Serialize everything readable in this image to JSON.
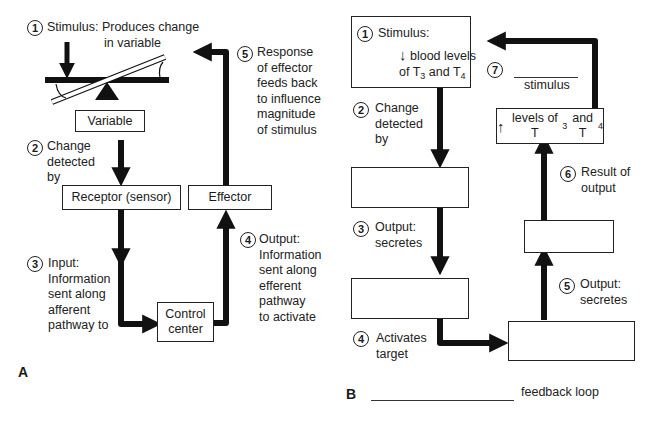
{
  "panel_a": {
    "label": "A",
    "steps": [
      {
        "num": "1",
        "text": "Stimulus: Produces change",
        "text2": "in variable"
      },
      {
        "num": "2",
        "lines": [
          "Change",
          "detected",
          "by"
        ]
      },
      {
        "num": "3",
        "lines": [
          "Input:",
          "Information",
          "sent along",
          "afferent",
          "pathway to"
        ]
      },
      {
        "num": "4",
        "lines": [
          "Output:",
          "Information",
          "sent along",
          "efferent",
          "pathway",
          "to activate"
        ]
      },
      {
        "num": "5",
        "lines": [
          "Response",
          "of effector",
          "feeds back",
          "to influence",
          "magnitude",
          "of stimulus"
        ]
      }
    ],
    "boxes": {
      "variable": "Variable",
      "receptor": "Receptor (sensor)",
      "effector": "Effector",
      "control_line1": "Control",
      "control_line2": "center"
    }
  },
  "panel_b": {
    "label": "B",
    "footer_blank": "",
    "footer_text": "feedback loop",
    "stimulus_box": {
      "num": "1",
      "title": "Stimulus:",
      "arrow": "↓",
      "line1": "blood levels",
      "line2_pre": "of T",
      "sub3": "3",
      "mid": " and T",
      "sub4": "4"
    },
    "result_box": {
      "arrow": "↑",
      "pre": "levels of T",
      "sub3": "3",
      "mid": " and T",
      "sub4": "4"
    },
    "steps": [
      {
        "num": "2",
        "lines": [
          "Change",
          "detected",
          "by"
        ]
      },
      {
        "num": "3",
        "lines": [
          "Output:",
          "secretes"
        ]
      },
      {
        "num": "4",
        "lines": [
          "Activates",
          "target"
        ]
      },
      {
        "num": "5",
        "lines": [
          "Output:",
          "secretes"
        ]
      },
      {
        "num": "6",
        "lines": [
          "Result of",
          "output"
        ]
      },
      {
        "num": "7",
        "blank": "",
        "text": "stimulus"
      }
    ],
    "blank_boxes": [
      "",
      "",
      "",
      ""
    ]
  }
}
